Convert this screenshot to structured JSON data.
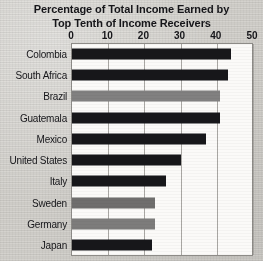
{
  "chart_data": {
    "type": "bar",
    "orientation": "horizontal",
    "title": "Percentage of Total Income Earned by Top Tenth of Income Receivers",
    "title_lines": [
      "Percentage of Total Income Earned by",
      "Top Tenth of Income Receivers"
    ],
    "xlabel": "",
    "ylabel": "",
    "xlim": [
      0,
      50
    ],
    "xticks": [
      0,
      10,
      20,
      30,
      40,
      50
    ],
    "xtick_labels": [
      "0",
      "10",
      "20",
      "30",
      "40",
      "50"
    ],
    "grid": true,
    "grid_axis": "x",
    "legend": false,
    "axis_label_position": "top",
    "categories": [
      "Colombia",
      "South Africa",
      "Brazil",
      "Guatemala",
      "Mexico",
      "United States",
      "Italy",
      "Sweden",
      "Germany",
      "Japan"
    ],
    "values": [
      44,
      43,
      41,
      41,
      37,
      30,
      26,
      23,
      23,
      22
    ],
    "bar_colors": [
      "#17171a",
      "#17171a",
      "#818080",
      "#17171a",
      "#17171a",
      "#17171a",
      "#17171a",
      "#6f6e6d",
      "#7d7c7b",
      "#17171a"
    ],
    "bars": [
      {
        "category": "Colombia",
        "value": 44,
        "color": "#17171a"
      },
      {
        "category": "South Africa",
        "value": 43,
        "color": "#17171a"
      },
      {
        "category": "Brazil",
        "value": 41,
        "color": "#818080"
      },
      {
        "category": "Guatemala",
        "value": 41,
        "color": "#17171a"
      },
      {
        "category": "Mexico",
        "value": 37,
        "color": "#17171a"
      },
      {
        "category": "United States",
        "value": 30,
        "color": "#17171a"
      },
      {
        "category": "Italy",
        "value": 26,
        "color": "#17171a"
      },
      {
        "category": "Sweden",
        "value": 23,
        "color": "#6f6e6d"
      },
      {
        "category": "Germany",
        "value": 23,
        "color": "#7d7c7b"
      },
      {
        "category": "Japan",
        "value": 22,
        "color": "#17171a"
      }
    ]
  },
  "colors": {
    "page_background": "#d2d0cb",
    "plot_background": "#fbfaf8",
    "gridline": "#a9a7a3",
    "axis_border": "#8d8b87",
    "text": "#16161a",
    "bar_dark": "#17171a",
    "bar_gray": "#7d7c7b"
  }
}
